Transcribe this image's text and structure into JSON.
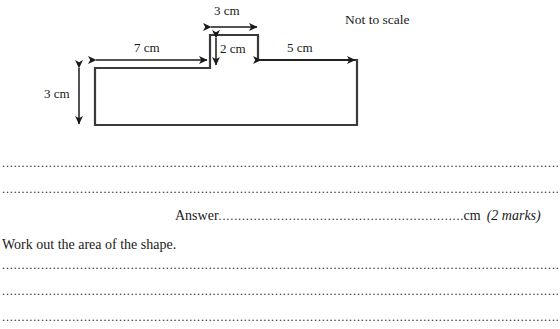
{
  "figure": {
    "caption": "Not to scale",
    "labels": {
      "top_width": "3 cm",
      "left_width": "7 cm",
      "step_height": "2 cm",
      "right_width": "5 cm",
      "body_height": "3 cm"
    },
    "shape": {
      "name": "stepped-rectangle",
      "stroke_color": "#3a3a3a",
      "fill_color": "#ffffff"
    }
  },
  "answer_area": {
    "dotted_line": "..................................................................................................................................................................................................",
    "answer_label": "Answer",
    "answer_dots": ".........................................................................",
    "answer_unit": "cm",
    "marks": "(2 marks)",
    "question_text": "Work out the area of the shape."
  }
}
